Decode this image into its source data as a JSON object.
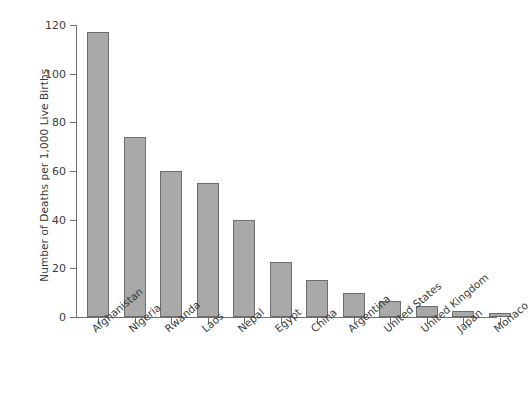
{
  "chart_data": {
    "type": "bar",
    "title": "",
    "subtitle": "",
    "xlabel": "",
    "ylabel": "Number of Deaths per 1,000 Live Births",
    "categories": [
      "Afghanistan",
      "Nigeria",
      "Rwanda",
      "Laos",
      "Nepal",
      "Egypt",
      "China",
      "Argentina",
      "United States",
      "United Kingdom",
      "Japan",
      "Monaco"
    ],
    "values": [
      117,
      74,
      60,
      55,
      40,
      22.5,
      15.3,
      10,
      6.5,
      4.5,
      2.3,
      1.5
    ],
    "ylim": [
      0,
      120
    ],
    "y_ticks": [
      0,
      20,
      40,
      60,
      80,
      100,
      120
    ],
    "y_tick_labels": [
      "0",
      "20",
      "40",
      "60",
      "80",
      "100",
      "120"
    ],
    "grid": false,
    "legend": false,
    "legend_position": "none",
    "bar_fill_color": "#a9a9a9",
    "bar_border_color": "#6d6d6d",
    "axis_color": "#6f6f6f",
    "text_color": "#3b3b3b",
    "background_color": "#ffffff"
  }
}
